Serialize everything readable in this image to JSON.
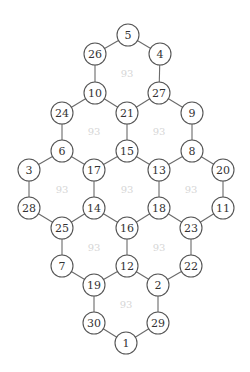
{
  "diagram": {
    "type": "hexagonal-graph",
    "node_radius": 11,
    "colors": {
      "node_stroke": "#555555",
      "edge": "#6a6a6a",
      "node_text": "#333333",
      "face_label": "#d6d6d6",
      "background": "#ffffff"
    },
    "nodes": [
      {
        "id": "5",
        "x": 128,
        "y": 35
      },
      {
        "id": "26",
        "x": 95,
        "y": 54
      },
      {
        "id": "4",
        "x": 160,
        "y": 54
      },
      {
        "id": "10",
        "x": 95,
        "y": 93
      },
      {
        "id": "27",
        "x": 159,
        "y": 93
      },
      {
        "id": "24",
        "x": 62,
        "y": 113
      },
      {
        "id": "21",
        "x": 127,
        "y": 113
      },
      {
        "id": "9",
        "x": 192,
        "y": 113
      },
      {
        "id": "6",
        "x": 62,
        "y": 151
      },
      {
        "id": "15",
        "x": 127,
        "y": 151
      },
      {
        "id": "8",
        "x": 192,
        "y": 151
      },
      {
        "id": "3",
        "x": 29,
        "y": 170
      },
      {
        "id": "17",
        "x": 94,
        "y": 170
      },
      {
        "id": "13",
        "x": 159,
        "y": 170
      },
      {
        "id": "20",
        "x": 223,
        "y": 170
      },
      {
        "id": "28",
        "x": 29,
        "y": 208
      },
      {
        "id": "14",
        "x": 94,
        "y": 208
      },
      {
        "id": "18",
        "x": 159,
        "y": 208
      },
      {
        "id": "11",
        "x": 223,
        "y": 208
      },
      {
        "id": "25",
        "x": 62,
        "y": 228
      },
      {
        "id": "16",
        "x": 127,
        "y": 228
      },
      {
        "id": "23",
        "x": 191,
        "y": 228
      },
      {
        "id": "7",
        "x": 62,
        "y": 266
      },
      {
        "id": "12",
        "x": 127,
        "y": 266
      },
      {
        "id": "22",
        "x": 191,
        "y": 266
      },
      {
        "id": "19",
        "x": 94,
        "y": 285
      },
      {
        "id": "2",
        "x": 158,
        "y": 285
      },
      {
        "id": "30",
        "x": 94,
        "y": 323
      },
      {
        "id": "29",
        "x": 158,
        "y": 323
      },
      {
        "id": "1",
        "x": 126,
        "y": 343
      }
    ],
    "edges": [
      [
        "5",
        "26"
      ],
      [
        "5",
        "4"
      ],
      [
        "26",
        "10"
      ],
      [
        "4",
        "27"
      ],
      [
        "10",
        "21"
      ],
      [
        "27",
        "21"
      ],
      [
        "10",
        "24"
      ],
      [
        "27",
        "9"
      ],
      [
        "24",
        "6"
      ],
      [
        "21",
        "15"
      ],
      [
        "9",
        "8"
      ],
      [
        "6",
        "17"
      ],
      [
        "15",
        "17"
      ],
      [
        "15",
        "13"
      ],
      [
        "8",
        "13"
      ],
      [
        "6",
        "3"
      ],
      [
        "8",
        "20"
      ],
      [
        "3",
        "28"
      ],
      [
        "17",
        "14"
      ],
      [
        "13",
        "18"
      ],
      [
        "20",
        "11"
      ],
      [
        "28",
        "25"
      ],
      [
        "14",
        "25"
      ],
      [
        "14",
        "16"
      ],
      [
        "18",
        "16"
      ],
      [
        "18",
        "23"
      ],
      [
        "11",
        "23"
      ],
      [
        "25",
        "7"
      ],
      [
        "16",
        "12"
      ],
      [
        "23",
        "22"
      ],
      [
        "7",
        "19"
      ],
      [
        "12",
        "19"
      ],
      [
        "12",
        "2"
      ],
      [
        "22",
        "2"
      ],
      [
        "19",
        "30"
      ],
      [
        "2",
        "29"
      ],
      [
        "30",
        "1"
      ],
      [
        "29",
        "1"
      ]
    ],
    "face_labels": [
      {
        "text": "93",
        "x": 127,
        "y": 73
      },
      {
        "text": "93",
        "x": 94,
        "y": 131
      },
      {
        "text": "93",
        "x": 159,
        "y": 131
      },
      {
        "text": "93",
        "x": 62,
        "y": 189
      },
      {
        "text": "93",
        "x": 127,
        "y": 189
      },
      {
        "text": "93",
        "x": 191,
        "y": 189
      },
      {
        "text": "93",
        "x": 94,
        "y": 247
      },
      {
        "text": "93",
        "x": 159,
        "y": 247
      },
      {
        "text": "93",
        "x": 126,
        "y": 304
      }
    ]
  }
}
